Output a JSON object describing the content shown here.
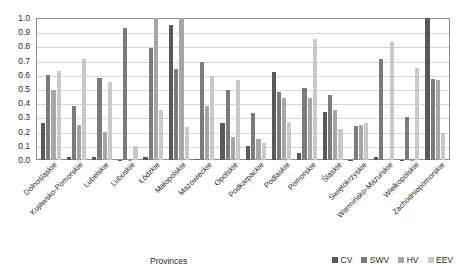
{
  "chart_data": {
    "type": "bar",
    "title": "",
    "xlabel": "Provinces",
    "ylabel": "",
    "ylim": [
      0.0,
      1.0
    ],
    "ytick_step": 0.1,
    "grid": true,
    "legend_position": "bottom-right",
    "ytick_labels": [
      "1.0",
      "0.9",
      "0.8",
      "0.7",
      "0.6",
      "0.5",
      "0.4",
      "0.3",
      "0.2",
      "0.1",
      "0.0"
    ],
    "ytick_values": [
      1.0,
      0.9,
      0.8,
      0.7,
      0.6,
      0.5,
      0.4,
      0.3,
      0.2,
      0.1,
      0.0
    ],
    "categories": [
      "Dolnośląskie",
      "Kujawsko-Pomorskie",
      "Lubelskie",
      "Lubuskie",
      "Łódzkie",
      "Małopolskie",
      "Mazowieckie",
      "Opolskie",
      "Podkarpackie",
      "Podlaskie",
      "Pomorskie",
      "Śląskie",
      "Świętokrzyskie",
      "Warmińsko-Mazurskie",
      "Wielkopolskie",
      "Zachodniopomorskie"
    ],
    "series": [
      {
        "name": "CV",
        "color": "#595959",
        "values": [
          0.26,
          0.02,
          0.02,
          0.0,
          0.02,
          0.95,
          0.01,
          0.26,
          0.1,
          0.62,
          0.05,
          0.34,
          0.0,
          0.02,
          0.0,
          1.0
        ]
      },
      {
        "name": "SWV",
        "color": "#7b7b7b",
        "values": [
          0.6,
          0.38,
          0.58,
          0.93,
          0.79,
          0.64,
          0.69,
          0.49,
          0.33,
          0.48,
          0.51,
          0.46,
          0.24,
          0.71,
          0.3,
          0.57
        ]
      },
      {
        "name": "HV",
        "color": "#a6a6a6",
        "values": [
          0.49,
          0.25,
          0.2,
          0.0,
          1.0,
          1.0,
          0.38,
          0.16,
          0.15,
          0.44,
          0.44,
          0.35,
          0.25,
          0.01,
          0.0,
          0.56
        ]
      },
      {
        "name": "EEV",
        "color": "#c9c9c9",
        "values": [
          0.63,
          0.71,
          0.55,
          0.1,
          0.35,
          0.23,
          0.59,
          0.56,
          0.12,
          0.27,
          0.85,
          0.22,
          0.26,
          0.83,
          0.65,
          0.19
        ]
      }
    ]
  },
  "legend": {
    "items": [
      {
        "label": "CV",
        "color": "#595959"
      },
      {
        "label": "SWV",
        "color": "#7b7b7b"
      },
      {
        "label": "HV",
        "color": "#a6a6a6"
      },
      {
        "label": "EEV",
        "color": "#c9c9c9"
      }
    ]
  },
  "axis_title": {
    "x": "Provinces"
  }
}
